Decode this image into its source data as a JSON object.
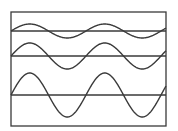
{
  "diagram": {
    "title": "",
    "stroke_color": "#3a3a3a",
    "background": "#ffffff",
    "frame": {
      "x": 11,
      "y": 12,
      "width": 155,
      "height": 114
    },
    "waves": [
      {
        "name": "wave-1",
        "baseline_y": 31,
        "amplitude": 7,
        "period": 75,
        "phase_start": "up",
        "cycles": 2
      },
      {
        "name": "wave-2",
        "baseline_y": 56,
        "amplitude": 13,
        "period": 75,
        "phase_start": "up",
        "cycles": 2
      },
      {
        "name": "wave-3",
        "baseline_y": 95,
        "amplitude": 22,
        "period": 75,
        "phase_start": "up",
        "cycles": 2
      }
    ]
  }
}
